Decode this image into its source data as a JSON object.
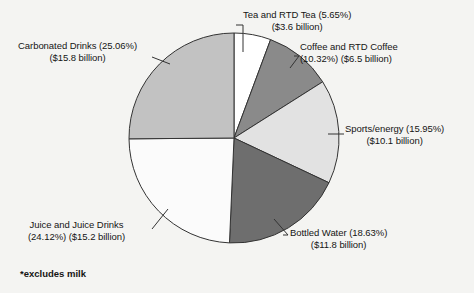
{
  "chart_data": {
    "type": "pie",
    "title": "",
    "subtitle": "",
    "footnote": "*excludes milk",
    "legend_position": "callout-labels",
    "units": "USD billion",
    "total_percent": 99.73,
    "categories": [
      "Tea and RTD Tea",
      "Coffee and RTD Coffee",
      "Sports/energy",
      "Bottled Water",
      "Juice and Juice Drinks",
      "Carbonated Drinks"
    ],
    "values": [
      5.65,
      10.32,
      15.95,
      18.63,
      24.12,
      25.06
    ],
    "dollar_values": [
      3.6,
      6.5,
      10.1,
      11.8,
      15.2,
      15.8
    ],
    "slices": [
      {
        "name": "Tea and RTD Tea",
        "percent": 5.65,
        "percent_text": "(5.65%)",
        "dollars_text": "($3.6 billion)",
        "label_line1": "Tea and RTD Tea (5.65%)",
        "label_line2": "($3.6 billion)",
        "color": "#ffffff"
      },
      {
        "name": "Coffee and RTD Coffee",
        "percent": 10.32,
        "percent_text": "(10.32%)",
        "dollars_text": "($6.5 billion)",
        "label_line1": "Coffee and RTD Coffee",
        "label_line2": "(10.32%) ($6.5 billion)",
        "color": "#8a8a8a"
      },
      {
        "name": "Sports/energy",
        "percent": 15.95,
        "percent_text": "(15.95%)",
        "dollars_text": "($10.1 billion)",
        "label_line1": "Sports/energy (15.95%)",
        "label_line2": "($10.1 billion)",
        "color": "#e2e2e2"
      },
      {
        "name": "Bottled Water",
        "percent": 18.63,
        "percent_text": "(18.63%)",
        "dollars_text": "($11.8 billion)",
        "label_line1": "Bottled Water (18.63%)",
        "label_line2": "($11.8 billion)",
        "color": "#6e6e6e"
      },
      {
        "name": "Juice and Juice Drinks",
        "percent": 24.12,
        "percent_text": "(24.12%)",
        "dollars_text": "($15.2 billion)",
        "label_line1": "Juice and Juice Drinks",
        "label_line2": "(24.12%) ($15.2 billion)",
        "color": "#fbfbfb"
      },
      {
        "name": "Carbonated Drinks",
        "percent": 25.06,
        "percent_text": "(25.06%)",
        "dollars_text": "($15.8 billion)",
        "label_line1": "Carbonated Drinks (25.06%)",
        "label_line2": "($15.8 billion)",
        "color": "#c2c2c2"
      }
    ],
    "colors": {
      "background": "#f4f4f2",
      "outline": "#333333",
      "text": "#141414",
      "leader_line": "#333333"
    },
    "geometry": {
      "center_x": 234,
      "center_y": 138,
      "radius": 105,
      "start_angle_deg": 0,
      "direction": "clockwise"
    }
  }
}
